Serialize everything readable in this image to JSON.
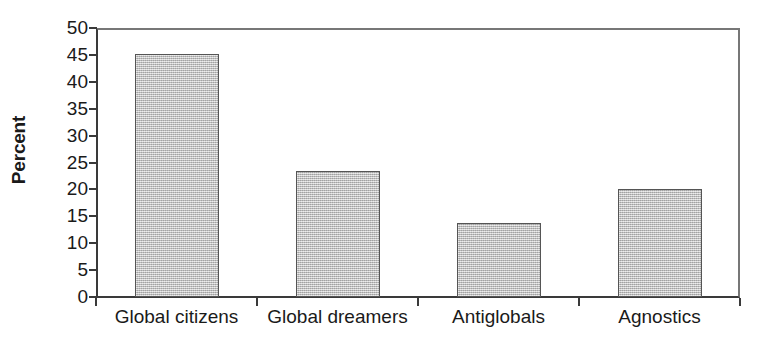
{
  "chart_data": {
    "type": "bar",
    "title": "",
    "subtitle": "",
    "xlabel": "",
    "ylabel": "Percent",
    "categories": [
      "Global citizens",
      "Global dreamers",
      "Antiglobals",
      "Agnostics"
    ],
    "values": [
      45.2,
      23.4,
      13.7,
      20.0
    ],
    "ylim": [
      0,
      50
    ],
    "y_ticks": [
      50,
      45,
      40,
      35,
      30,
      25,
      20,
      15,
      10,
      5,
      0
    ],
    "y_tick_labels": [
      "50",
      "45",
      "40",
      "35",
      "30",
      "25",
      "20",
      "15",
      "10",
      "5",
      "0"
    ],
    "grid": false,
    "legend": null,
    "legend_position": "none",
    "bar_fill_color": "#b9b9b9",
    "bar_border_color": "#555555",
    "axis_color": "#3a3a3a",
    "background_color": "#ffffff"
  },
  "axis": {
    "y_title": "Percent"
  }
}
